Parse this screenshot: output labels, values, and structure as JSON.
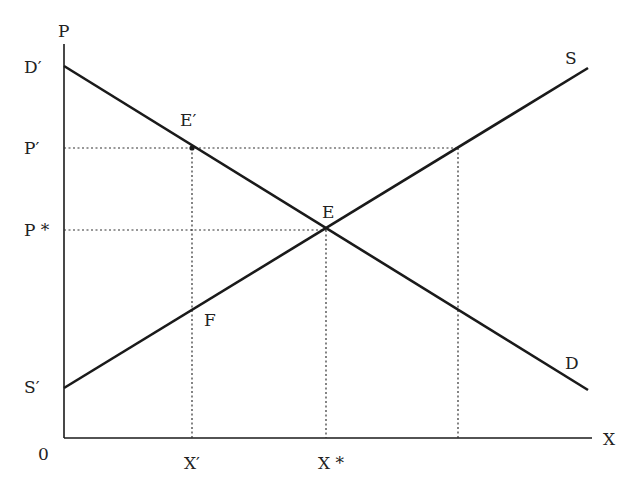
{
  "diagram": {
    "title": "",
    "type": "supply-demand",
    "axes": {
      "y_label": "P",
      "x_label": "X",
      "origin_label": "0"
    },
    "curves": {
      "demand": {
        "end_label": "D",
        "start_label": "D′"
      },
      "supply": {
        "end_label": "S",
        "start_label": "S′"
      }
    },
    "points": {
      "equilibrium": "E",
      "price_ceiling_point": "E′",
      "supply_point": "F"
    },
    "y_ticks": {
      "p_prime": "P′",
      "p_star": "P *"
    },
    "x_ticks": {
      "x_prime": "X′",
      "x_star": "X *"
    },
    "colors": {
      "line": "#1a1a1a",
      "dotted": "#333333",
      "text": "#222222"
    }
  }
}
